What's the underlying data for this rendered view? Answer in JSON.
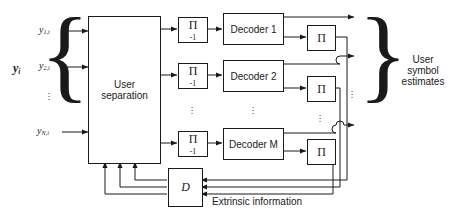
{
  "diagram": {
    "inputs": {
      "vector_label": "y",
      "vector_sub": "i",
      "signals": [
        {
          "base": "y",
          "sub": "1,i"
        },
        {
          "base": "y",
          "sub": "2,i"
        },
        {
          "base": "y",
          "sub": "N,i"
        }
      ],
      "ellipsis": "⋮"
    },
    "blocks": {
      "user_separation": {
        "line1": "User",
        "line2": "separation"
      },
      "deinterleaver": {
        "symbol": "Π",
        "exponent": "-1"
      },
      "interleaver": {
        "symbol": "Π"
      },
      "decoders": [
        "Decoder 1",
        "Decoder 2",
        "Decoder M"
      ],
      "delay": {
        "symbol": "D"
      }
    },
    "outputs": {
      "line1": "User",
      "line2": "symbol",
      "line3": "estimates"
    },
    "annotations": {
      "extrinsic": "Extrinsic information"
    },
    "colors": {
      "line": "#1a1a1a",
      "text": "#1a1a1a",
      "background": "#ffffff"
    }
  }
}
